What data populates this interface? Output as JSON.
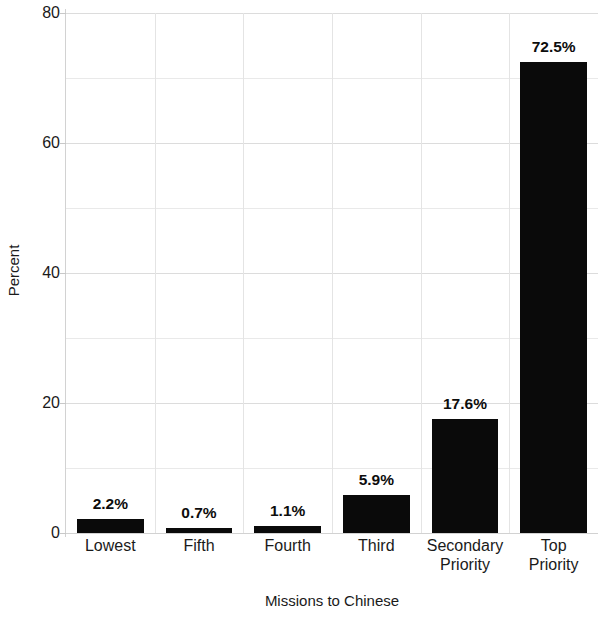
{
  "chart_data": {
    "type": "bar",
    "title": "",
    "xlabel": "Missions to Chinese",
    "ylabel": "Percent",
    "categories": [
      "Lowest",
      "Fifth",
      "Fourth",
      "Third",
      "Secondary Priority",
      "Top Priority"
    ],
    "category_lines": [
      [
        "Lowest"
      ],
      [
        "Fifth"
      ],
      [
        "Fourth"
      ],
      [
        "Third"
      ],
      [
        "Secondary",
        "Priority"
      ],
      [
        "Top",
        "Priority"
      ]
    ],
    "values": [
      2.2,
      0.7,
      1.1,
      5.9,
      17.6,
      72.5
    ],
    "value_labels": [
      "2.2%",
      "0.7%",
      "1.1%",
      "5.9%",
      "17.6%",
      "72.5%"
    ],
    "ylim": [
      0,
      80
    ],
    "ytick_values": [
      0,
      20,
      40,
      60,
      80
    ],
    "ytick_labels": [
      "0",
      "20",
      "40",
      "60",
      "80"
    ],
    "minor_gridline_values": [
      10,
      30,
      50,
      70
    ],
    "grid": true,
    "legend": "none",
    "bar_color": "#0a0a0a",
    "gridline_color": "#e4e4e4",
    "axis_color": "#d2d2d2",
    "text_color": "#1a1a1a"
  }
}
